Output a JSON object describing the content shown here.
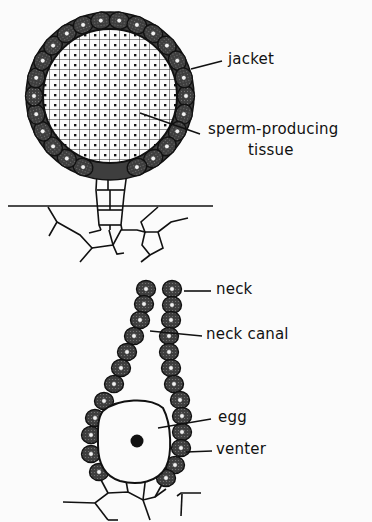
{
  "figure": {
    "top": {
      "name": "antheridium",
      "labels": {
        "jacket": "jacket",
        "sperm_line1": "sperm-producing",
        "sperm_line2": "tissue"
      }
    },
    "bottom": {
      "name": "archegonium",
      "labels": {
        "neck": "neck",
        "neck_canal": "neck canal",
        "egg": "egg",
        "venter": "venter"
      }
    },
    "colors": {
      "background": "#fbfbfb",
      "ink": "#111111",
      "cell_fill": "#4a4a4a",
      "nucleus": "#f2f2f2"
    }
  }
}
